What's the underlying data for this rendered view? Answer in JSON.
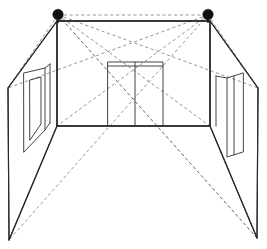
{
  "diagram": {
    "type": "line-drawing",
    "canvas": {
      "width": 267,
      "height": 249
    },
    "background_color": "#ffffff",
    "line_color": "#2b2b2b",
    "dashed_line_color": "#8a8a8a",
    "sensor_color": "#111111"
  },
  "sensors": [
    {
      "id": "sensor-left",
      "label": "Left ceiling sensor",
      "x": 58,
      "y": 15,
      "radius": 5.2,
      "color": "#111111"
    },
    {
      "id": "sensor-right",
      "label": "Right ceiling sensor",
      "x": 208,
      "y": 15,
      "radius": 5.2,
      "color": "#111111"
    }
  ],
  "room": {
    "back_wall": {
      "label": "Back wall",
      "top_left": {
        "x": 57,
        "y": 21
      },
      "top_right": {
        "x": 210,
        "y": 21
      },
      "bottom_right": {
        "x": 210,
        "y": 126
      },
      "bottom_left": {
        "x": 57,
        "y": 126
      }
    },
    "left_wall": {
      "label": "Left side wall",
      "near_top": {
        "x": 8,
        "y": 88
      },
      "near_bottom": {
        "x": 9,
        "y": 240
      },
      "far_top": {
        "x": 57,
        "y": 21
      },
      "far_bottom": {
        "x": 57,
        "y": 126
      }
    },
    "right_wall": {
      "label": "Right side wall",
      "near_top": {
        "x": 258,
        "y": 88
      },
      "near_bottom": {
        "x": 257,
        "y": 238
      },
      "far_top": {
        "x": 210,
        "y": 21
      },
      "far_bottom": {
        "x": 210,
        "y": 126
      }
    }
  },
  "features": {
    "doorway": {
      "label": "Back wall doorway",
      "left": 108,
      "right": 163,
      "top": 62,
      "bottom": 126,
      "mullion_x": 135
    },
    "left_window": {
      "label": "Left wall window panel",
      "outer_top": {
        "x": 24,
        "y": 73
      },
      "outer_bottom": {
        "x": 24,
        "y": 152
      },
      "inner_top": {
        "x": 45,
        "y": 68
      },
      "inner_bottom": {
        "x": 45,
        "y": 130
      }
    },
    "right_panel": {
      "label": "Right wall panel",
      "outer_top": {
        "x": 243,
        "y": 73
      },
      "outer_bottom": {
        "x": 243,
        "y": 152
      },
      "inner_top": {
        "x": 227,
        "y": 78
      },
      "inner_bottom": {
        "x": 227,
        "y": 157
      }
    }
  },
  "sight_lines": {
    "label": "Sensor coverage sight lines",
    "style": "dashed",
    "crossing_point": {
      "x": 134,
      "y": 103
    },
    "lines": [
      {
        "from": "sensor-left",
        "to_x": 258,
        "to_y": 88,
        "note": "left sensor to right near ceiling corner"
      },
      {
        "from": "sensor-left",
        "to_x": 257,
        "to_y": 238,
        "note": "left sensor to right near floor corner"
      },
      {
        "from": "sensor-left",
        "to_x": 210,
        "to_y": 126,
        "note": "left sensor to right back floor corner"
      },
      {
        "from": "sensor-left",
        "to_x": 8,
        "to_y": 88,
        "note": "left sensor to left near ceiling corner"
      },
      {
        "from": "sensor-right",
        "to_x": 8,
        "to_y": 88,
        "note": "right sensor to left near ceiling corner"
      },
      {
        "from": "sensor-right",
        "to_x": 9,
        "to_y": 240,
        "note": "right sensor to left near floor corner"
      },
      {
        "from": "sensor-right",
        "to_x": 57,
        "to_y": 126,
        "note": "right sensor to left back floor corner"
      },
      {
        "from": "sensor-right",
        "to_x": 258,
        "to_y": 88,
        "note": "right sensor to right near ceiling corner"
      }
    ]
  },
  "annotations": {
    "text_labels": []
  }
}
